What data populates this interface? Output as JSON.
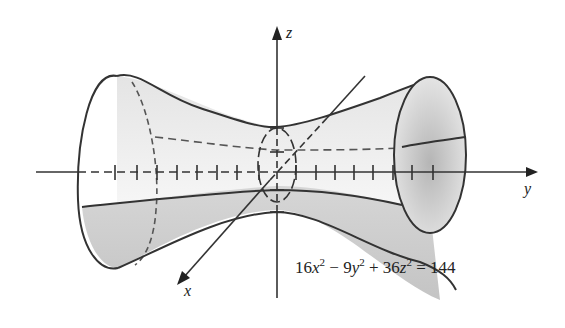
{
  "figure": {
    "axes": {
      "x_label": "x",
      "y_label": "y",
      "z_label": "z"
    },
    "equation": {
      "t1_coef": "16",
      "t1_var": "x",
      "t1_exp": "2",
      "op1": "−",
      "t2_coef": "9",
      "t2_var": "y",
      "t2_exp": "2",
      "op2": "+",
      "t3_coef": "36",
      "t3_var": "z",
      "t3_exp": "2",
      "eq": "=",
      "rhs": "144",
      "full": "16x^2 - 9y^2 + 36z^2 = 144"
    },
    "colors": {
      "line": "#333333",
      "shade_light": "#f2f2f2",
      "shade_dark": "#c8c8c8"
    }
  }
}
